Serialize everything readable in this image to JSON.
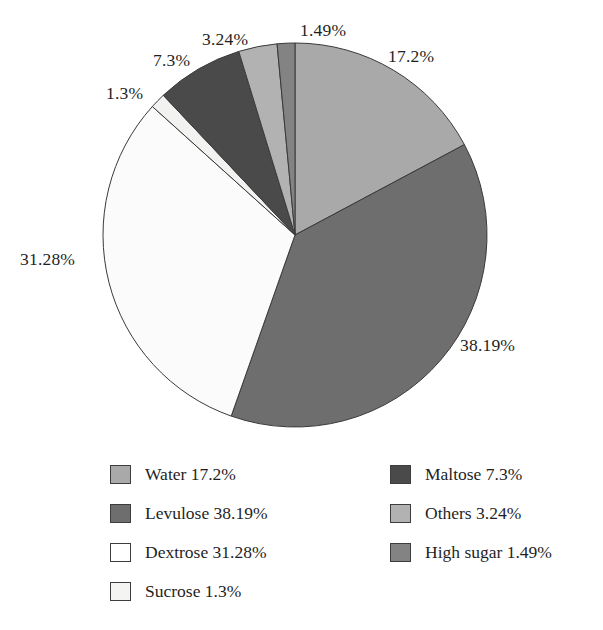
{
  "chart_data": {
    "type": "pie",
    "title": "",
    "subtitle": "",
    "xlabel": "",
    "ylabel": "",
    "grid": false,
    "legend_position": "bottom",
    "start_angle_deg": 0,
    "direction": "clockwise",
    "units": "%",
    "categories": [
      "Water",
      "Levulose",
      "Dextrose",
      "Sucrose",
      "Maltose",
      "Others",
      "High sugar"
    ],
    "values": [
      17.2,
      38.19,
      31.28,
      1.3,
      7.3,
      3.24,
      1.49
    ],
    "slices": [
      {
        "name": "Water",
        "value": 17.2,
        "label": "17.2%",
        "legend_label": "Water 17.2%",
        "color": "#a9a9a9"
      },
      {
        "name": "Levulose",
        "value": 38.19,
        "label": "38.19%",
        "legend_label": "Levulose 38.19%",
        "color": "#6e6e6e"
      },
      {
        "name": "Dextrose",
        "value": 31.28,
        "label": "31.28%",
        "legend_label": "Dextrose 31.28%",
        "color": "#fbfbfb"
      },
      {
        "name": "Sucrose",
        "value": 1.3,
        "label": "1.3%",
        "legend_label": "Sucrose 1.3%",
        "color": "#f2f2f0"
      },
      {
        "name": "Maltose",
        "value": 7.3,
        "label": "7.3%",
        "legend_label": "Maltose 7.3%",
        "color": "#4a4a4a"
      },
      {
        "name": "Others",
        "value": 3.24,
        "label": "3.24%",
        "legend_label": "Others 3.24%",
        "color": "#b2b2b2"
      },
      {
        "name": "High sugar",
        "value": 1.49,
        "label": "1.49%",
        "legend_label": "High sugar 1.49%",
        "color": "#838383"
      }
    ]
  },
  "callouts": {
    "water": "17.2%",
    "levulose": "38.19%",
    "dextrose": "31.28%",
    "sucrose": "1.3%",
    "maltose": "7.3%",
    "others": "3.24%",
    "high_sugar": "1.49%"
  },
  "legend": {
    "left_column": [
      {
        "label": "Water 17.2%",
        "color": "#a9a9a9"
      },
      {
        "label": "Levulose 38.19%",
        "color": "#6e6e6e"
      },
      {
        "label": "Dextrose 31.28%",
        "color": "#ffffff"
      },
      {
        "label": "Sucrose 1.3%",
        "color": "#f4f4f2"
      }
    ],
    "right_column": [
      {
        "label": "Maltose 7.3%",
        "color": "#4a4a4a"
      },
      {
        "label": "Others 3.24%",
        "color": "#b2b2b2"
      },
      {
        "label": "High sugar 1.49%",
        "color": "#838383"
      }
    ]
  }
}
